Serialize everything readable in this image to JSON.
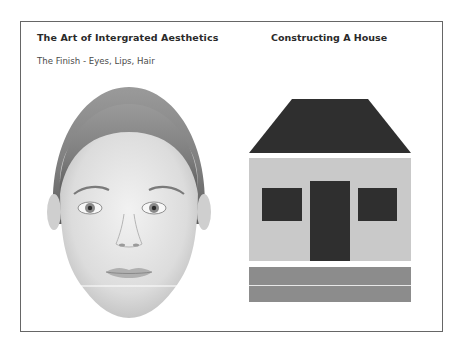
{
  "left_panel": {
    "title": "The Art of Intergrated Aesthetics",
    "subtitle": "The Finish - Eyes, Lips, Hair",
    "image": "face-portrait"
  },
  "right_panel": {
    "title": "Constructing A House",
    "image": "house-diagram",
    "parts": [
      "roof",
      "wall",
      "window-left",
      "door",
      "window-right",
      "foundation"
    ]
  },
  "colors": {
    "roof": "#2f2f2f",
    "wall": "#c9c9c9",
    "openings": "#2f2f2f",
    "foundation": "#8c8c8c",
    "frame_border": "#666666"
  }
}
